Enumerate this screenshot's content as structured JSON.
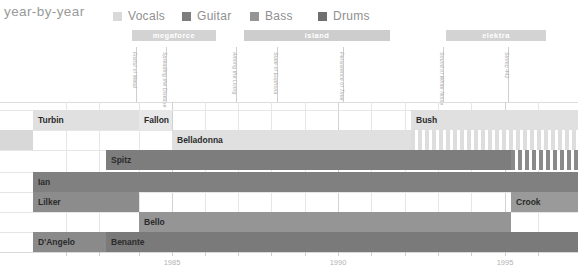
{
  "header": {
    "title": "year-by-year",
    "legend": [
      {
        "label": "Vocals",
        "color": "#d9d9d9",
        "x": 113
      },
      {
        "label": "Guitar",
        "color": "#7d7d7d",
        "x": 182
      },
      {
        "label": "Bass",
        "color": "#959595",
        "x": 250
      },
      {
        "label": "Drums",
        "color": "#6f6f6f",
        "x": 318
      }
    ]
  },
  "labels_bands": [
    {
      "name": "megaforce",
      "x": 132,
      "width": 84,
      "color": "#d3d3d3"
    },
    {
      "name": "island",
      "x": 244,
      "width": 146,
      "color": "#cdcdcd"
    },
    {
      "name": "elektra",
      "x": 446,
      "width": 100,
      "color": "#d3d3d3"
    }
  ],
  "albums": [
    {
      "title": "Fistful of Metal",
      "x": 136
    },
    {
      "title": "Spreading the Disease",
      "x": 166
    },
    {
      "title": "Among the Living",
      "x": 236
    },
    {
      "title": "State of Euphoria",
      "x": 277
    },
    {
      "title": "Persistence of Time",
      "x": 343
    },
    {
      "title": "Sound of White Noise",
      "x": 443
    },
    {
      "title": "Stomp 442",
      "x": 508
    }
  ],
  "axis": {
    "start_year": 1982,
    "end_year": 1997,
    "ticks": [
      {
        "label": "1985",
        "x": 172
      },
      {
        "label": "1990",
        "x": 338
      },
      {
        "label": "1995",
        "x": 505
      }
    ],
    "gridlines_major": [
      172,
      338,
      505
    ],
    "gridlines_minor": [
      66,
      99,
      139,
      205,
      238,
      271,
      305,
      371,
      405,
      438,
      471,
      538
    ]
  },
  "rows": [
    {
      "row": 0,
      "y": 110,
      "height": 20,
      "segments": [
        {
          "name": "Turbin",
          "instrument": "Vocals",
          "x": 33,
          "width": 106,
          "color": "#e0e0e0",
          "label_color": "dark"
        },
        {
          "name": "Fallon",
          "instrument": "Vocals",
          "x": 139,
          "width": 33,
          "color": "#e8e8e8",
          "label_color": "dark"
        },
        {
          "name": "Bush",
          "instrument": "Vocals",
          "x": 411,
          "width": 167,
          "color": "#e0e0e0",
          "label_color": "dark"
        }
      ]
    },
    {
      "row": 1,
      "y": 130,
      "height": 20,
      "segments": [
        {
          "name": "",
          "instrument": "Vocals",
          "x": 0,
          "width": 33,
          "color": "#d8d8d8",
          "label_color": "dark"
        },
        {
          "name": "Belladonna",
          "instrument": "Vocals",
          "x": 172,
          "width": 239,
          "color": "#e0e0e0",
          "label_color": "dark"
        },
        {
          "name": "",
          "instrument": "Vocals",
          "x": 411,
          "width": 167,
          "color": "#dddddd",
          "label_color": "dark",
          "striped": true
        }
      ]
    },
    {
      "row": 2,
      "y": 150,
      "height": 20,
      "segments": [
        {
          "name": "Spitz",
          "instrument": "Guitar",
          "x": 106,
          "width": 405,
          "color": "#7d7d7d",
          "label_color": "dark"
        },
        {
          "name": "",
          "instrument": "Guitar",
          "x": 511,
          "width": 67,
          "color": "#8a8a8a",
          "label_color": "dark",
          "striped": true
        }
      ]
    },
    {
      "row": 3,
      "y": 172,
      "height": 20,
      "segments": [
        {
          "name": "Ian",
          "instrument": "Guitar",
          "x": 33,
          "width": 545,
          "color": "#808080",
          "label_color": "dark"
        }
      ]
    },
    {
      "row": 4,
      "y": 192,
      "height": 20,
      "segments": [
        {
          "name": "Lilker",
          "instrument": "Bass",
          "x": 33,
          "width": 106,
          "color": "#8c8c8c",
          "label_color": "dark"
        },
        {
          "name": "Crook",
          "instrument": "Bass",
          "x": 511,
          "width": 67,
          "color": "#9a9a9a",
          "label_color": "dark"
        }
      ]
    },
    {
      "row": 5,
      "y": 212,
      "height": 20,
      "segments": [
        {
          "name": "Bello",
          "instrument": "Bass",
          "x": 139,
          "width": 372,
          "color": "#959595",
          "label_color": "dark"
        }
      ]
    },
    {
      "row": 6,
      "y": 232,
      "height": 20,
      "segments": [
        {
          "name": "D'Angelo",
          "instrument": "Drums",
          "x": 33,
          "width": 73,
          "color": "#8a8a8a",
          "label_color": "dark"
        },
        {
          "name": "Benante",
          "instrument": "Drums",
          "x": 106,
          "width": 472,
          "color": "#7a7a7a",
          "label_color": "dark"
        }
      ]
    }
  ],
  "plot": {
    "left": 0,
    "top": 102,
    "width": 578,
    "height": 150
  }
}
